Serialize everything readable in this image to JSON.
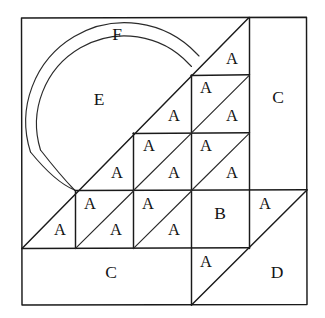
{
  "figure": {
    "background_color": "#ffffff",
    "line_color": "#1a1a1a",
    "border": {
      "x": 21,
      "y": 17,
      "width": 286,
      "height": 288
    },
    "grid": {
      "vertical_lines_x": [
        75,
        133,
        191,
        249
      ],
      "horizontal_lines_y": [
        75,
        133,
        190,
        248
      ],
      "cell_size": 58
    },
    "arcs": {
      "description": "two concentric arcs forming annulus F around inner disk E",
      "center": {
        "x": 128,
        "y": 107
      },
      "outer_radius": 99,
      "inner_radius": 88
    },
    "diagonals": {
      "main_diagonal": {
        "from_x": 22,
        "from_y": 248,
        "to_x": 249,
        "to_y": 17
      },
      "lower_right_diagonal": {
        "from_x": 191,
        "from_y": 305,
        "to_x": 307,
        "to_y": 190
      }
    },
    "labels": [
      {
        "id": "label-F",
        "text": "F",
        "x": 117,
        "y": 36
      },
      {
        "id": "label-E",
        "text": "E",
        "x": 99,
        "y": 101
      },
      {
        "id": "label-C-right",
        "text": "C",
        "x": 278,
        "y": 99
      },
      {
        "id": "label-C-bottom",
        "text": "C",
        "x": 111,
        "y": 274
      },
      {
        "id": "label-D",
        "text": "D",
        "x": 277,
        "y": 274
      },
      {
        "id": "label-B",
        "text": "B",
        "x": 220,
        "y": 215
      },
      {
        "id": "label-A-r0c3-upper",
        "text": "A",
        "x": 232,
        "y": 60
      },
      {
        "id": "label-A-r1c2-upper",
        "text": "A",
        "x": 174,
        "y": 117
      },
      {
        "id": "label-A-r1c3-lower",
        "text": "A",
        "x": 206,
        "y": 89
      },
      {
        "id": "label-A-r1c3-upper",
        "text": "A",
        "x": 232,
        "y": 117
      },
      {
        "id": "label-A-r2c1-upper",
        "text": "A",
        "x": 117,
        "y": 174
      },
      {
        "id": "label-A-r2c2-lower",
        "text": "A",
        "x": 149,
        "y": 147
      },
      {
        "id": "label-A-r2c2-upper",
        "text": "A",
        "x": 174,
        "y": 174
      },
      {
        "id": "label-A-r2c3-lower",
        "text": "A",
        "x": 206,
        "y": 147
      },
      {
        "id": "label-A-r2c3-upper",
        "text": "A",
        "x": 232,
        "y": 174
      },
      {
        "id": "label-A-r3c0-upper",
        "text": "A",
        "x": 60,
        "y": 231
      },
      {
        "id": "label-A-r3c1-lower",
        "text": "A",
        "x": 90,
        "y": 205
      },
      {
        "id": "label-A-r3c1-upper",
        "text": "A",
        "x": 116,
        "y": 231
      },
      {
        "id": "label-A-r3c2-lower",
        "text": "A",
        "x": 148,
        "y": 205
      },
      {
        "id": "label-A-r3c2-upper",
        "text": "A",
        "x": 174,
        "y": 231
      },
      {
        "id": "label-A-r3c4-lower",
        "text": "A",
        "x": 265,
        "y": 205
      },
      {
        "id": "label-A-below-grid",
        "text": "A",
        "x": 206,
        "y": 263
      }
    ]
  }
}
